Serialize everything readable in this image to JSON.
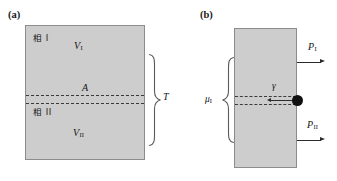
{
  "figure": {
    "caption_a": "(a)",
    "caption_b": "(b)"
  },
  "panel_a": {
    "label": "(a)",
    "phase_top": "相 I",
    "phase_bottom": "相 II",
    "volume_top": "V",
    "volume_top_sub": "I",
    "volume_bottom": "V",
    "volume_bottom_sub": "II",
    "interface_area": "A",
    "brace_label": "T",
    "block_fill": "#cdcdcd",
    "block_stroke": "#8c8c8c",
    "dash_color": "#3a3a3a"
  },
  "panel_b": {
    "label": "(b)",
    "chemical_potential": "μ",
    "chemical_potential_sub": "I",
    "surface_tension": "γ",
    "pressure_top": "P",
    "pressure_top_sub": "I",
    "pressure_bottom": "P",
    "pressure_bottom_sub": "II",
    "block_fill": "#cdcdcd",
    "block_stroke": "#8c8c8c",
    "dash_color": "#3a3a3a",
    "dot_color": "#111111",
    "arrow_color": "#2b2b2b"
  }
}
